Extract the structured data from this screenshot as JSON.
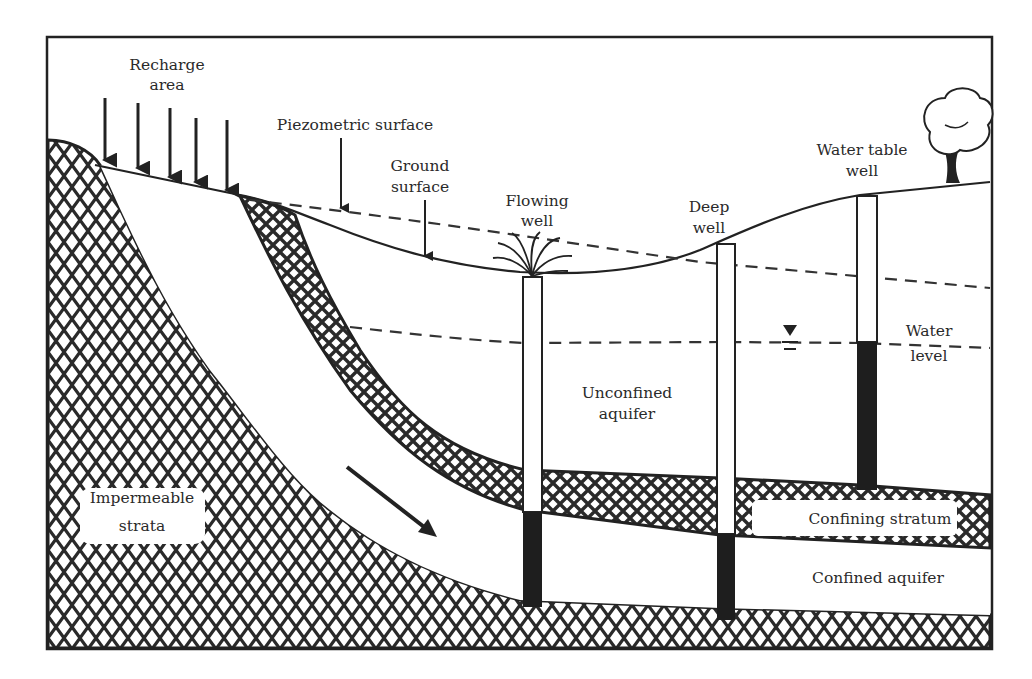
{
  "diagram": {
    "labels": {
      "recharge_area_1": "Recharge",
      "recharge_area_2": "area",
      "piezometric_surface": "Piezometric surface",
      "ground_surface_1": "Ground",
      "ground_surface_2": "surface",
      "flowing_well_1": "Flowing",
      "flowing_well_2": "well",
      "deep_well_1": "Deep",
      "deep_well_2": "well",
      "water_table_well_1": "Water table",
      "water_table_well_2": "well",
      "water_level_1": "Water",
      "water_level_2": "level",
      "unconfined_aquifer_1": "Unconfined",
      "unconfined_aquifer_2": "aquifer",
      "impermeable_strata_1": "Impermeable",
      "impermeable_strata_2": "strata",
      "confining_stratum": "Confining stratum",
      "confined_aquifer": "Confined aquifer"
    },
    "icons": {
      "recharge_arrows": "down-arrow",
      "flow_arrow": "diagonal-arrow",
      "water_level_marker": "inverted-triangle",
      "tree": "tree"
    },
    "colors": {
      "ink": "#222222",
      "background": "#ffffff",
      "hatch": "#2a2a2a"
    }
  }
}
